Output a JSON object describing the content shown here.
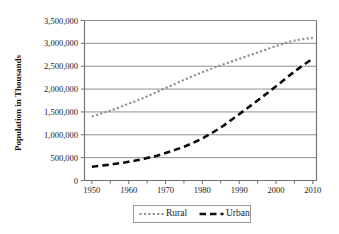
{
  "chart_data": {
    "type": "line",
    "title": "",
    "xlabel": "",
    "ylabel": "Population in Thousands",
    "xlim": [
      1948,
      2011
    ],
    "ylim": [
      0,
      3500000
    ],
    "grid": true,
    "grid_axis": "y",
    "legend_position": "bottom",
    "x_tick_labels": [
      "1950",
      "1960",
      "1970",
      "1980",
      "1990",
      "2000",
      "2010"
    ],
    "x_ticks_major": [
      1950,
      1960,
      1970,
      1980,
      1990,
      2000,
      2010
    ],
    "x_ticks_minor": [
      1955,
      1965,
      1975,
      1985,
      1995,
      2005
    ],
    "y_tick_labels": [
      "0",
      "500,000",
      "1,000,000",
      "1,500,000",
      "2,000,000",
      "2,500,000",
      "3,000,000",
      "3,500,000"
    ],
    "y_ticks": [
      0,
      500000,
      1000000,
      1500000,
      2000000,
      2500000,
      3000000,
      3500000
    ],
    "x": [
      1950,
      1955,
      1960,
      1965,
      1970,
      1975,
      1980,
      1985,
      1990,
      1995,
      2000,
      2005,
      2010
    ],
    "series": [
      {
        "name": "Rural",
        "style": "dotted",
        "color": "#8c8c8c",
        "values": [
          1400000,
          1530000,
          1680000,
          1840000,
          2020000,
          2200000,
          2370000,
          2520000,
          2660000,
          2800000,
          2940000,
          3060000,
          3120000
        ]
      },
      {
        "name": "Urban",
        "style": "dashed",
        "color": "#0d0d0d",
        "values": [
          300000,
          350000,
          410000,
          490000,
          600000,
          740000,
          920000,
          1160000,
          1450000,
          1750000,
          2060000,
          2380000,
          2670000
        ]
      }
    ]
  },
  "legend": {
    "items": [
      {
        "label": "Rural",
        "style": "dotted",
        "color": "#8c8c8c"
      },
      {
        "label": "Urban",
        "style": "dashed",
        "color": "#0d0d0d"
      }
    ]
  },
  "colors": {
    "background": "#ffffff",
    "axis": "#6e6e6e",
    "grid": "#8f8f8f",
    "text": "#1b1b1b",
    "rural": "#8c8c8c",
    "urban": "#0d0d0d",
    "legend_border": "#9a9a9a"
  }
}
